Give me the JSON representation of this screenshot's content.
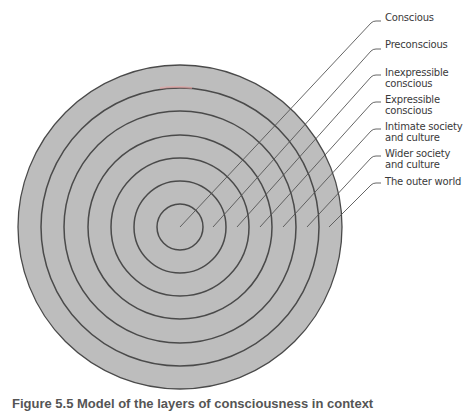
{
  "diagram": {
    "type": "concentric-circles",
    "center": [
      180,
      227
    ],
    "fill_color": "#bdbdbd",
    "stroke_color": "#4a4a4a",
    "leader_color": "#555555",
    "ring_radii": [
      162,
      139,
      116,
      92,
      69,
      46,
      23
    ],
    "labels": [
      {
        "lines": [
          "Conscious"
        ],
        "top": 12,
        "tick_y": 21,
        "anchor_x": 180
      },
      {
        "lines": [
          "Preconscious"
        ],
        "top": 39,
        "tick_y": 49,
        "anchor_x": 213
      },
      {
        "lines": [
          "Inexpressible",
          "conscious"
        ],
        "top": 67,
        "tick_y": 75,
        "anchor_x": 237
      },
      {
        "lines": [
          "Expressible",
          "conscious"
        ],
        "top": 94,
        "tick_y": 102,
        "anchor_x": 260
      },
      {
        "lines": [
          "Intimate society",
          "and culture"
        ],
        "top": 121,
        "tick_y": 129,
        "anchor_x": 283
      },
      {
        "lines": [
          "Wider society",
          "and culture"
        ],
        "top": 148,
        "tick_y": 156,
        "anchor_x": 307
      },
      {
        "lines": [
          "The outer world"
        ],
        "top": 176,
        "tick_y": 183,
        "anchor_x": 329
      }
    ]
  },
  "caption": {
    "text": "Figure 5.5  Model of the layers of consciousness in context"
  }
}
